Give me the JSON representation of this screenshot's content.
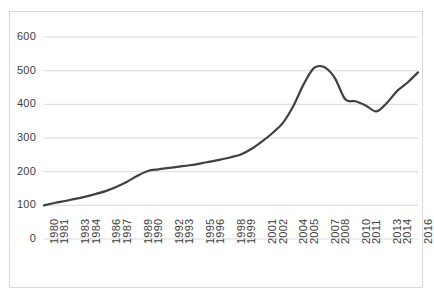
{
  "chart_data": {
    "type": "line",
    "title": "",
    "subtitle": "",
    "xlabel": "",
    "ylabel": "",
    "grid": true,
    "legend": false,
    "legend_position": "none",
    "line_color": "#404040",
    "gridline_color": "#d9d9d9",
    "border_color": "#d9d9d9",
    "background_color": "#ffffff",
    "xlim": [
      1980,
      2016
    ],
    "ylim": [
      0,
      600
    ],
    "ytick_labels": [
      "600",
      "500",
      "400",
      "300",
      "200",
      "100",
      "0"
    ],
    "ytick_values": [
      600,
      500,
      400,
      300,
      200,
      100,
      0
    ],
    "xtick_labels": [
      "1980",
      "1981",
      "1983",
      "1984",
      "1986",
      "1987",
      "1989",
      "1990",
      "1992",
      "1993",
      "1995",
      "1996",
      "1998",
      "1999",
      "2001",
      "2002",
      "2004",
      "2005",
      "2007",
      "2008",
      "2010",
      "2011",
      "2013",
      "2014",
      "2016"
    ],
    "xtick_values": [
      1980,
      1981,
      1983,
      1984,
      1986,
      1987,
      1989,
      1990,
      1992,
      1993,
      1995,
      1996,
      1998,
      1999,
      2001,
      2002,
      2004,
      2005,
      2007,
      2008,
      2010,
      2011,
      2013,
      2014,
      2016
    ],
    "x": [
      1980,
      1981,
      1982,
      1983,
      1984,
      1985,
      1986,
      1987,
      1988,
      1989,
      1990,
      1991,
      1992,
      1993,
      1994,
      1995,
      1996,
      1997,
      1998,
      1999,
      2000,
      2001,
      2002,
      2003,
      2004,
      2005,
      2006,
      2007,
      2008,
      2009,
      2010,
      2011,
      2012,
      2013,
      2014,
      2015,
      2016
    ],
    "values": [
      100,
      107,
      113,
      119,
      126,
      134,
      143,
      155,
      170,
      188,
      202,
      207,
      211,
      215,
      219,
      224,
      230,
      236,
      243,
      252,
      268,
      290,
      315,
      345,
      395,
      460,
      508,
      510,
      478,
      415,
      409,
      396,
      379,
      404,
      440,
      465,
      495
    ],
    "series": [
      {
        "name": "series-1",
        "values": [
          100,
          107,
          113,
          119,
          126,
          134,
          143,
          155,
          170,
          188,
          202,
          207,
          211,
          215,
          219,
          224,
          230,
          236,
          243,
          252,
          268,
          290,
          315,
          345,
          395,
          460,
          508,
          510,
          478,
          415,
          409,
          396,
          379,
          404,
          440,
          465,
          495
        ]
      }
    ]
  }
}
